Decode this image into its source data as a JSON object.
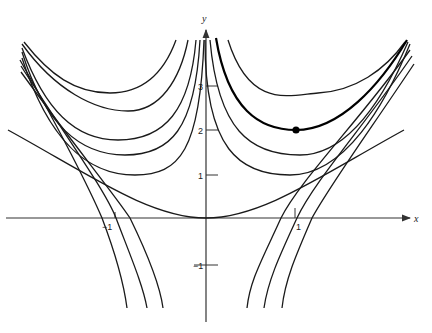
{
  "chart_data": {
    "type": "line",
    "title": "",
    "xlabel": "x",
    "ylabel": "y",
    "xlim": [
      -2.3,
      2.3
    ],
    "ylim": [
      -2.6,
      4.9
    ],
    "grid": false,
    "legend": null,
    "x_ticks": [
      {
        "value": -1,
        "label": "-1"
      },
      {
        "value": 1,
        "label": "1"
      }
    ],
    "y_ticks": [
      {
        "value": -1,
        "label": "-1"
      },
      {
        "value": 1,
        "label": "1"
      },
      {
        "value": 2,
        "label": "2"
      },
      {
        "value": 3,
        "label": "3"
      }
    ],
    "highlighted_point": {
      "x": 1,
      "y": 2
    },
    "series": [
      {
        "name": "parabola-through-origin",
        "points": [
          [
            -2.2,
            2.0
          ],
          [
            -1.5,
            1.0
          ],
          [
            -1.0,
            0.45
          ],
          [
            -0.5,
            0.1
          ],
          [
            0,
            0
          ],
          [
            0.5,
            0.1
          ],
          [
            1.0,
            0.45
          ],
          [
            1.5,
            1.0
          ],
          [
            2.2,
            2.0
          ]
        ]
      },
      {
        "name": "right-upper-1",
        "points": [
          [
            0.22,
            4.0
          ],
          [
            0.6,
            3.2
          ],
          [
            1.24,
            2.84
          ],
          [
            1.8,
            3.3
          ],
          [
            2.2,
            4.0
          ]
        ]
      },
      {
        "name": "right-upper-2-highlighted",
        "points": [
          [
            0.1,
            4.0
          ],
          [
            0.45,
            2.6
          ],
          [
            1.0,
            2.0
          ],
          [
            1.6,
            2.6
          ],
          [
            2.2,
            4.0
          ]
        ]
      },
      {
        "name": "right-upper-3",
        "points": [
          [
            0.03,
            4.0
          ],
          [
            0.4,
            2.0
          ],
          [
            1.16,
            1.43
          ],
          [
            1.8,
            2.4
          ],
          [
            2.2,
            3.9
          ]
        ]
      },
      {
        "name": "right-upper-4",
        "points": [
          [
            -0.05,
            4.0
          ],
          [
            0.35,
            1.5
          ],
          [
            1.04,
            0.98
          ],
          [
            1.8,
            2.2
          ],
          [
            2.2,
            3.6
          ]
        ]
      },
      {
        "name": "right-lower-1",
        "points": [
          [
            2.2,
            3.6
          ],
          [
            1.5,
            1.6
          ],
          [
            0.85,
            0.0
          ],
          [
            0.4,
            -1.2
          ],
          [
            0.25,
            -2.0
          ]
        ]
      },
      {
        "name": "right-lower-2",
        "points": [
          [
            2.2,
            3.4
          ],
          [
            1.5,
            1.4
          ],
          [
            0.98,
            0.0
          ],
          [
            0.55,
            -1.2
          ],
          [
            0.4,
            -2.0
          ]
        ]
      },
      {
        "name": "right-lower-3",
        "points": [
          [
            2.2,
            3.2
          ],
          [
            1.6,
            1.4
          ],
          [
            1.13,
            0.0
          ],
          [
            0.75,
            -1.2
          ],
          [
            0.6,
            -2.0
          ]
        ]
      },
      {
        "name": "left-upper-1",
        "points": [
          [
            -2.2,
            4.0
          ],
          [
            -1.6,
            3.0
          ],
          [
            -1.07,
            2.84
          ],
          [
            -0.55,
            3.4
          ],
          [
            -0.3,
            4.0
          ]
        ]
      },
      {
        "name": "left-upper-2",
        "points": [
          [
            -2.2,
            3.9
          ],
          [
            -1.4,
            2.6
          ],
          [
            -0.87,
            2.43
          ],
          [
            -0.35,
            3.3
          ],
          [
            -0.15,
            4.0
          ]
        ]
      },
      {
        "name": "left-upper-3",
        "points": [
          [
            -2.2,
            3.8
          ],
          [
            -1.6,
            2.0
          ],
          [
            -1.18,
            1.77
          ],
          [
            -0.4,
            2.6
          ],
          [
            -0.05,
            4.0
          ]
        ]
      },
      {
        "name": "left-upper-4",
        "points": [
          [
            -2.2,
            3.7
          ],
          [
            -1.6,
            1.7
          ],
          [
            -1.07,
            1.43
          ],
          [
            -0.3,
            2.2
          ],
          [
            0.0,
            4.0
          ]
        ]
      },
      {
        "name": "left-upper-5",
        "points": [
          [
            -2.2,
            3.6
          ],
          [
            -1.6,
            1.2
          ],
          [
            -1.03,
            0.98
          ],
          [
            -0.25,
            1.8
          ],
          [
            0.05,
            4.0
          ]
        ]
      },
      {
        "name": "left-lower-1",
        "points": [
          [
            -2.2,
            3.4
          ],
          [
            -1.6,
            1.4
          ],
          [
            -1.15,
            0.0
          ],
          [
            -0.75,
            -1.2
          ],
          [
            -0.6,
            -2.0
          ]
        ]
      },
      {
        "name": "left-lower-2",
        "points": [
          [
            -2.2,
            3.2
          ],
          [
            -1.5,
            1.3
          ],
          [
            -1.0,
            0.0
          ],
          [
            -0.55,
            -1.2
          ],
          [
            -0.42,
            -2.0
          ]
        ]
      },
      {
        "name": "left-lower-3",
        "points": [
          [
            -2.2,
            3.0
          ],
          [
            -1.4,
            1.2
          ],
          [
            -0.85,
            0.0
          ],
          [
            -0.4,
            -1.2
          ],
          [
            -0.25,
            -2.0
          ]
        ]
      }
    ]
  },
  "axes": {
    "x_label": "x",
    "y_label": "y",
    "tick_labels": {
      "x_neg1": "−1",
      "x_pos1": "1",
      "y_neg1": "−1",
      "y_1": "1",
      "y_2": "2",
      "y_3": "3"
    }
  },
  "render": {
    "origin_px": [
      206,
      218
    ],
    "x_scale_px": 90,
    "y_scale_px": 44,
    "paths": [
      {
        "name": "parabola-through-origin",
        "bold": false,
        "d": "M 8 130 C 90 175, 150 218, 206 218 C 262 218, 322 175, 404 130"
      },
      {
        "name": "right-upper-1",
        "bold": false,
        "d": "M 228 40 C 250 110, 290 95, 318 93 C 355 91, 385 70, 405 42"
      },
      {
        "name": "right-upper-2-highlighted",
        "bold": true,
        "d": "M 216 38 C 228 110, 260 130, 296 130 C 340 130, 380 85, 407 40"
      },
      {
        "name": "right-upper-3",
        "bold": false,
        "d": "M 210 40 C 218 130, 250 155, 300 155 C 350 155, 385 95, 408 42"
      },
      {
        "name": "right-upper-4",
        "bold": false,
        "d": "M 205 40 C 205 150, 240 175, 290 175 C 345 175, 385 105, 410 44"
      },
      {
        "name": "right-lower-1",
        "bold": false,
        "d": "M 410 50 C 360 120, 300 180, 281 218 C 262 260, 250 280, 247 308"
      },
      {
        "name": "right-lower-2",
        "bold": false,
        "d": "M 412 56 C 365 125, 315 180, 297 218 C 280 255, 268 280, 264 308"
      },
      {
        "name": "right-lower-3",
        "bold": false,
        "d": "M 414 64 C 370 130, 330 185, 312 218 C 296 255, 285 280, 282 308"
      },
      {
        "name": "left-upper-1",
        "bold": false,
        "d": "M 24 42 C 50 75, 75 93, 110 93 C 145 93, 165 70, 176 40"
      },
      {
        "name": "left-upper-2",
        "bold": false,
        "d": "M 22 44 C 55 90, 95 111, 128 111 C 160 111, 180 80, 188 40"
      },
      {
        "name": "left-upper-3",
        "bold": false,
        "d": "M 22 48 C 45 110, 75 140, 118 140 C 165 140, 190 110, 196 40"
      },
      {
        "name": "left-upper-4",
        "bold": false,
        "d": "M 22 52 C 45 125, 80 155, 125 155 C 170 155, 195 130, 200 40"
      },
      {
        "name": "left-upper-5",
        "bold": false,
        "d": "M 22 58 C 50 145, 90 175, 135 175 C 180 175, 200 150, 204 40"
      },
      {
        "name": "left-lower-1",
        "bold": false,
        "d": "M 20 60 C 60 130, 90 190, 102 218 C 116 255, 124 285, 127 308"
      },
      {
        "name": "left-lower-2",
        "bold": false,
        "d": "M 21 66 C 65 135, 105 190, 116 218 C 130 255, 143 285, 147 308"
      },
      {
        "name": "left-lower-3",
        "bold": false,
        "d": "M 21 72 C 70 140, 115 195, 130 218 C 148 255, 160 285, 163 308"
      }
    ]
  }
}
